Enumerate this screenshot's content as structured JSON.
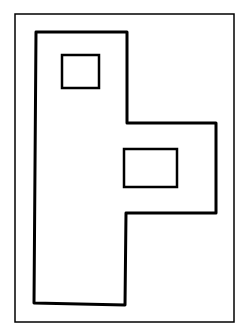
{
  "diagram": {
    "background": "#ffffff",
    "stroke": "#000000",
    "frame": {
      "x": 15,
      "y": 14,
      "width": 219,
      "height": 308,
      "stroke_width": 1.5
    },
    "outline": {
      "points": "36,32 127,32 127,123 216,123 216,213 126,213 125,305 34,303",
      "stroke_width": 3
    },
    "rects": [
      {
        "name": "upper-window",
        "x": 62,
        "y": 55,
        "width": 37,
        "height": 33,
        "stroke_width": 2.5
      },
      {
        "name": "middle-window",
        "x": 124,
        "y": 149,
        "width": 53,
        "height": 38,
        "stroke_width": 2.5
      }
    ]
  }
}
